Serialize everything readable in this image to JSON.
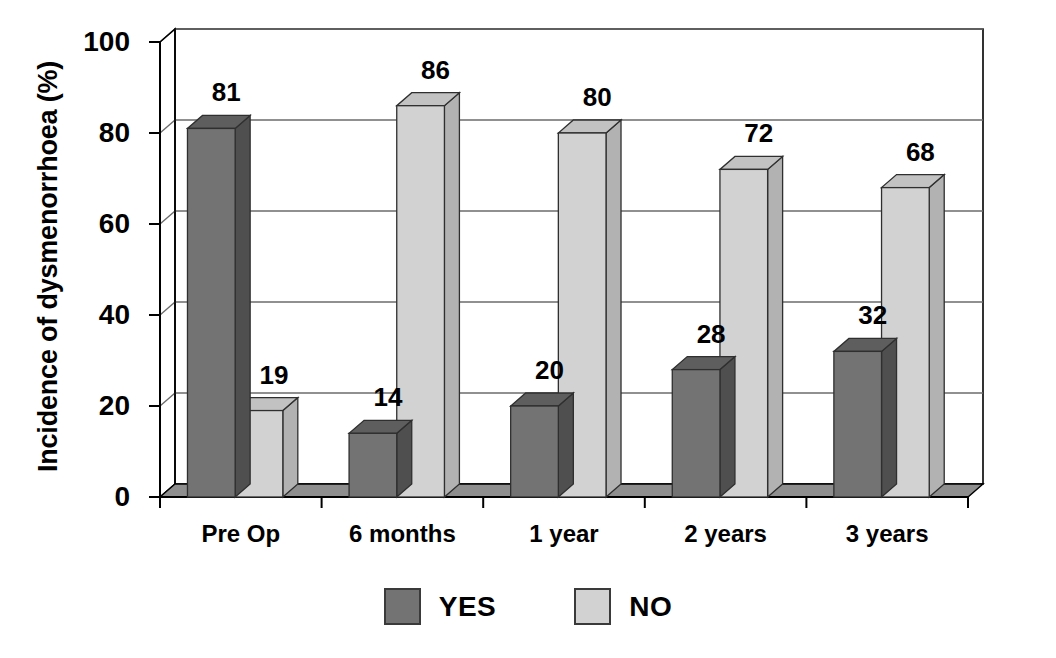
{
  "chart_data": {
    "type": "bar",
    "title": "",
    "subtitle": "",
    "xlabel": "",
    "ylabel": "Incidence of dysmenorrhoea (%)",
    "categories": [
      "Pre Op",
      "6 months",
      "1 year",
      "2 years",
      "3 years"
    ],
    "series": [
      {
        "name": "YES",
        "values": [
          81,
          14,
          20,
          28,
          32
        ],
        "color": "#737373"
      },
      {
        "name": "NO",
        "values": [
          19,
          86,
          80,
          72,
          68
        ],
        "color": "#d2d2d2"
      }
    ],
    "ylim": [
      0,
      100
    ],
    "yticks": [
      0,
      20,
      40,
      60,
      80,
      100
    ],
    "ytick_labels": [
      "0",
      "20",
      "40",
      "60",
      "80",
      "100"
    ],
    "grid": "horizontal-on-back-wall",
    "legend_position": "bottom-center",
    "style": "3d-bars",
    "data_labels": [
      {
        "category": "Pre Op",
        "series": "YES",
        "value": 81,
        "label": "81"
      },
      {
        "category": "Pre Op",
        "series": "NO",
        "value": 19,
        "label": "19"
      },
      {
        "category": "6 months",
        "series": "YES",
        "value": 14,
        "label": "14"
      },
      {
        "category": "6 months",
        "series": "NO",
        "value": 86,
        "label": "86"
      },
      {
        "category": "1 year",
        "series": "YES",
        "value": 20,
        "label": "20"
      },
      {
        "category": "1 year",
        "series": "NO",
        "value": 80,
        "label": "80"
      },
      {
        "category": "2 years",
        "series": "YES",
        "value": 28,
        "label": "28"
      },
      {
        "category": "2 years",
        "series": "NO",
        "value": 72,
        "label": "72"
      },
      {
        "category": "3 years",
        "series": "YES",
        "value": 32,
        "label": "32"
      },
      {
        "category": "3 years",
        "series": "NO",
        "value": 68,
        "label": "68"
      }
    ]
  },
  "legend": {
    "items": [
      {
        "label": "YES",
        "color": "#737373"
      },
      {
        "label": "NO",
        "color": "#d2d2d2"
      }
    ]
  },
  "colors": {
    "series_yes": "#737373",
    "series_yes_top": "#5e5e5e",
    "series_yes_side": "#4f4f4f",
    "series_no": "#d2d2d2",
    "series_no_top": "#c2c2c2",
    "series_no_side": "#b2b2b2",
    "floor": "#8e8e8e",
    "floor_front": "#7a7a7a",
    "wall": "#ffffff",
    "axis": "#000000",
    "grid": "#6b6b6b"
  }
}
